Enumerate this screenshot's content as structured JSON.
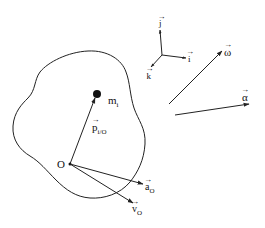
{
  "diagram": {
    "type": "rigid-body-kinematics",
    "colors": {
      "ink": "#222222",
      "background": "#ffffff"
    },
    "body": {
      "name": "rigid body outline"
    },
    "mass": {
      "label": "m",
      "subscript": "i"
    },
    "origin": {
      "label": "O"
    },
    "position_vector": {
      "label": "p",
      "subscript": "i/O"
    },
    "accel_origin": {
      "label": "a",
      "subscript": "O"
    },
    "vel_origin": {
      "label": "v",
      "subscript": "O"
    },
    "frame": {
      "i": {
        "label": "i"
      },
      "j": {
        "label": "j"
      },
      "k": {
        "label": "k"
      }
    },
    "omega": {
      "label": "ω"
    },
    "alpha": {
      "label": "α"
    },
    "vector_mark": "⃗"
  }
}
